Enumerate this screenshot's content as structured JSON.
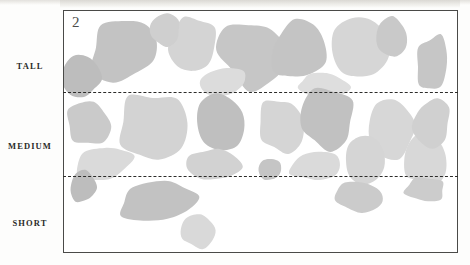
{
  "figure": {
    "panel_number": "2",
    "background_color": "#fdfdfc",
    "frame_color": "#4a4a48",
    "divider_color": "#2c2c2a"
  },
  "row_labels": [
    {
      "key": "tall",
      "text": "TALL"
    },
    {
      "key": "medium",
      "text": "MEDIUM"
    },
    {
      "key": "short",
      "text": "SHORT"
    }
  ],
  "chart_data": {
    "type": "scatter",
    "title": "",
    "subtitle": "",
    "xlabel": "",
    "ylabel": "",
    "legend": [],
    "grid": false,
    "annotations": [
      "2"
    ],
    "axis_ranges": {
      "x": [
        0,
        395
      ],
      "y": [
        0,
        243
      ]
    },
    "strata": [
      {
        "label": "TALL",
        "y_top": 0,
        "y_bottom": 81,
        "blob_count": 11
      },
      {
        "label": "MEDIUM",
        "y_top": 81,
        "y_bottom": 165,
        "blob_count": 13
      },
      {
        "label": "SHORT",
        "y_top": 165,
        "y_bottom": 243,
        "blob_count": 5
      }
    ],
    "dividers_y": [
      81,
      165
    ],
    "palette": [
      "#b9b9b9",
      "#c6c6c6",
      "#d0d0d0",
      "#d9d9d9",
      "#e0e0e0"
    ],
    "blobs": [
      {
        "id": 1,
        "stratum": "TALL",
        "cx": 73,
        "cy": 38,
        "rx": 43,
        "ry": 33,
        "fill": "#c3c3c3",
        "rot": -14,
        "seed": 11
      },
      {
        "id": 2,
        "stratum": "TALL",
        "cx": 154,
        "cy": 33,
        "rx": 28,
        "ry": 28,
        "fill": "#d4d4d4",
        "rot": 8,
        "seed": 23
      },
      {
        "id": 3,
        "stratum": "TALL",
        "cx": 228,
        "cy": 44,
        "rx": 44,
        "ry": 35,
        "fill": "#c6c6c6",
        "rot": 22,
        "seed": 31
      },
      {
        "id": 4,
        "stratum": "TALL",
        "cx": 22,
        "cy": 66,
        "rx": 24,
        "ry": 22,
        "fill": "#bdbdbd",
        "rot": 6,
        "seed": 47
      },
      {
        "id": 5,
        "stratum": "TALL",
        "cx": 190,
        "cy": 71,
        "rx": 32,
        "ry": 14,
        "fill": "#dcdcdc",
        "rot": -4,
        "seed": 53
      },
      {
        "id": 6,
        "stratum": "TALL",
        "cx": 280,
        "cy": 40,
        "rx": 35,
        "ry": 32,
        "fill": "#c4c4c4",
        "rot": -18,
        "seed": 67
      },
      {
        "id": 7,
        "stratum": "TALL",
        "cx": 355,
        "cy": 38,
        "rx": 33,
        "ry": 31,
        "fill": "#d6d6d6",
        "rot": 12,
        "seed": 71
      },
      {
        "id": 8,
        "stratum": "TALL",
        "cx": 310,
        "cy": 75,
        "rx": 31,
        "ry": 12,
        "fill": "#dedede",
        "rot": 3,
        "seed": 83
      },
      {
        "id": 9,
        "stratum": "TALL",
        "cx": 392,
        "cy": 28,
        "rx": 22,
        "ry": 21,
        "fill": "#c9c9c9",
        "rot": -9,
        "seed": 97
      },
      {
        "id": 10,
        "stratum": "TALL",
        "cx": 440,
        "cy": 52,
        "rx": 19,
        "ry": 28,
        "fill": "#c6c6c6",
        "rot": 14,
        "seed": 101
      },
      {
        "id": 11,
        "stratum": "TALL",
        "cx": 120,
        "cy": 20,
        "rx": 20,
        "ry": 16,
        "fill": "#cfcfcf",
        "rot": 0,
        "seed": 109
      },
      {
        "id": 12,
        "stratum": "MEDIUM",
        "cx": 104,
        "cy": 118,
        "rx": 41,
        "ry": 36,
        "fill": "#d3d3d3",
        "rot": -7,
        "seed": 127
      },
      {
        "id": 13,
        "stratum": "MEDIUM",
        "cx": 190,
        "cy": 112,
        "rx": 31,
        "ry": 29,
        "fill": "#bfbfbf",
        "rot": 16,
        "seed": 131
      },
      {
        "id": 14,
        "stratum": "MEDIUM",
        "cx": 258,
        "cy": 116,
        "rx": 26,
        "ry": 28,
        "fill": "#d5d5d5",
        "rot": -11,
        "seed": 139
      },
      {
        "id": 15,
        "stratum": "MEDIUM",
        "cx": 28,
        "cy": 112,
        "rx": 27,
        "ry": 24,
        "fill": "#cacaca",
        "rot": 9,
        "seed": 149
      },
      {
        "id": 16,
        "stratum": "MEDIUM",
        "cx": 47,
        "cy": 155,
        "rx": 34,
        "ry": 18,
        "fill": "#dadada",
        "rot": -13,
        "seed": 151
      },
      {
        "id": 17,
        "stratum": "MEDIUM",
        "cx": 315,
        "cy": 110,
        "rx": 33,
        "ry": 31,
        "fill": "#c1c1c1",
        "rot": 5,
        "seed": 163
      },
      {
        "id": 18,
        "stratum": "MEDIUM",
        "cx": 392,
        "cy": 118,
        "rx": 30,
        "ry": 30,
        "fill": "#d7d7d7",
        "rot": -6,
        "seed": 167
      },
      {
        "id": 19,
        "stratum": "MEDIUM",
        "cx": 180,
        "cy": 155,
        "rx": 30,
        "ry": 17,
        "fill": "#d2d2d2",
        "rot": 4,
        "seed": 173
      },
      {
        "id": 20,
        "stratum": "MEDIUM",
        "cx": 246,
        "cy": 160,
        "rx": 14,
        "ry": 11,
        "fill": "#c5c5c5",
        "rot": 0,
        "seed": 179
      },
      {
        "id": 21,
        "stratum": "MEDIUM",
        "cx": 300,
        "cy": 157,
        "rx": 29,
        "ry": 15,
        "fill": "#dadada",
        "rot": -3,
        "seed": 181
      },
      {
        "id": 22,
        "stratum": "MEDIUM",
        "cx": 360,
        "cy": 150,
        "rx": 24,
        "ry": 24,
        "fill": "#d5d5d5",
        "rot": 18,
        "seed": 191
      },
      {
        "id": 23,
        "stratum": "MEDIUM",
        "cx": 431,
        "cy": 150,
        "rx": 24,
        "ry": 27,
        "fill": "#d8d8d8",
        "rot": -15,
        "seed": 193
      },
      {
        "id": 24,
        "stratum": "MEDIUM",
        "cx": 440,
        "cy": 112,
        "rx": 22,
        "ry": 24,
        "fill": "#d0d0d0",
        "rot": 7,
        "seed": 197
      },
      {
        "id": 25,
        "stratum": "SHORT",
        "cx": 114,
        "cy": 194,
        "rx": 53,
        "ry": 21,
        "fill": "#c2c2c2",
        "rot": -8,
        "seed": 199
      },
      {
        "id": 26,
        "stratum": "SHORT",
        "cx": 352,
        "cy": 189,
        "rx": 31,
        "ry": 15,
        "fill": "#cbcbcb",
        "rot": 5,
        "seed": 211
      },
      {
        "id": 27,
        "stratum": "SHORT",
        "cx": 160,
        "cy": 223,
        "rx": 22,
        "ry": 16,
        "fill": "#d9d9d9",
        "rot": -5,
        "seed": 223
      },
      {
        "id": 28,
        "stratum": "SHORT",
        "cx": 22,
        "cy": 178,
        "rx": 16,
        "ry": 16,
        "fill": "#bdbdbd",
        "rot": 0,
        "seed": 227
      },
      {
        "id": 29,
        "stratum": "SHORT",
        "cx": 432,
        "cy": 180,
        "rx": 25,
        "ry": 14,
        "fill": "#cccccc",
        "rot": 3,
        "seed": 229
      }
    ]
  }
}
